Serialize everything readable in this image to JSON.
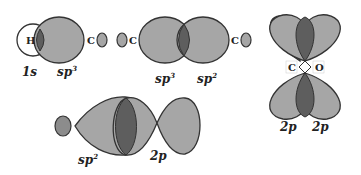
{
  "diagram": {
    "colors": {
      "lobe_fill": "#a6a6a6",
      "overlap_fill": "#5e5e5e",
      "outline": "#333333",
      "background": "#ffffff"
    },
    "panel_1": {
      "atoms": [
        "H",
        "C"
      ],
      "labels": [
        {
          "base": "1",
          "italic": "s",
          "sup": ""
        },
        {
          "base": "",
          "italic": "sp",
          "sup": "3"
        }
      ]
    },
    "panel_2": {
      "atoms": [
        "C",
        "C"
      ],
      "labels": [
        {
          "base": "",
          "italic": "sp",
          "sup": "3"
        },
        {
          "base": "",
          "italic": "sp",
          "sup": "2"
        }
      ]
    },
    "panel_3": {
      "atoms": [
        "C",
        "O"
      ],
      "labels": [
        {
          "base": "2",
          "italic": "p",
          "sup": ""
        },
        {
          "base": "2",
          "italic": "p",
          "sup": ""
        }
      ]
    },
    "panel_4": {
      "labels": [
        {
          "base": "",
          "italic": "sp",
          "sup": "2"
        },
        {
          "base": "2",
          "italic": "p",
          "sup": ""
        }
      ]
    }
  }
}
